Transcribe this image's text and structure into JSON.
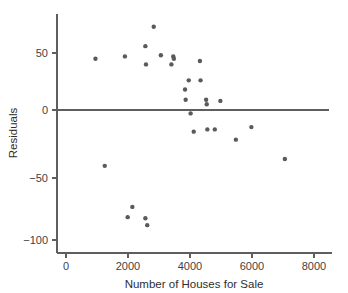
{
  "chart_data": {
    "type": "scatter",
    "title": "",
    "subtitle": "",
    "xlabel": "Number of Houses for Sale",
    "ylabel": "Residuals",
    "xlim": [
      -400,
      8400
    ],
    "ylim": [
      -112,
      78
    ],
    "grid": false,
    "legend": null,
    "xticks": [
      0,
      2000,
      4000,
      6000,
      8000
    ],
    "xtick_labels": [
      "0",
      "2000",
      "4000",
      "6000",
      "8000"
    ],
    "yticks": [
      50,
      0,
      -50,
      -100
    ],
    "ytick_labels": [
      "50",
      "0",
      "−50",
      "−100"
    ],
    "annotations": [
      {
        "name": "zero-reference-line",
        "type": "hline",
        "y": 0,
        "x_start": -400,
        "x_end": 8400
      }
    ],
    "marker": {
      "shape": "circle",
      "size": 2.2,
      "color": "#5a5a5a"
    },
    "points": [
      {
        "x": 950,
        "y": 45
      },
      {
        "x": 1250,
        "y": -49
      },
      {
        "x": 1900,
        "y": 47
      },
      {
        "x": 1990,
        "y": -94
      },
      {
        "x": 2140,
        "y": -85
      },
      {
        "x": 2560,
        "y": 56
      },
      {
        "x": 2580,
        "y": 40
      },
      {
        "x": 2560,
        "y": -95
      },
      {
        "x": 2620,
        "y": -101
      },
      {
        "x": 2830,
        "y": 73
      },
      {
        "x": 3060,
        "y": 48
      },
      {
        "x": 3400,
        "y": 40
      },
      {
        "x": 3460,
        "y": 47
      },
      {
        "x": 3480,
        "y": 45
      },
      {
        "x": 3840,
        "y": 18
      },
      {
        "x": 3860,
        "y": 9
      },
      {
        "x": 3960,
        "y": 26
      },
      {
        "x": 4020,
        "y": -3
      },
      {
        "x": 4120,
        "y": -19
      },
      {
        "x": 4320,
        "y": 43
      },
      {
        "x": 4340,
        "y": 26
      },
      {
        "x": 4520,
        "y": 9
      },
      {
        "x": 4540,
        "y": 5
      },
      {
        "x": 4560,
        "y": -17
      },
      {
        "x": 4800,
        "y": -17
      },
      {
        "x": 4980,
        "y": 8
      },
      {
        "x": 5480,
        "y": -26
      },
      {
        "x": 5980,
        "y": -15
      },
      {
        "x": 7060,
        "y": -43
      }
    ],
    "n_points": 29
  },
  "axes": {
    "y_axis_name": "residuals-axis",
    "x_axis_name": "houses-for-sale-axis"
  }
}
